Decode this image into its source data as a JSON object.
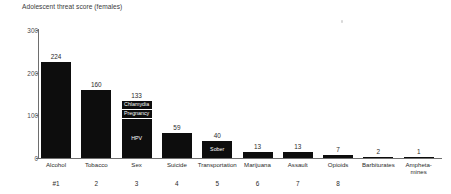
{
  "chart_data": {
    "type": "bar",
    "title": "Adolescent threat score (females)",
    "xlabel": "",
    "ylabel": "",
    "ylim": [
      0,
      300
    ],
    "yticks": [
      0,
      100,
      200,
      300
    ],
    "grid": false,
    "legend": "none",
    "categories": [
      "Alcohol",
      "Tobacco",
      "Sex",
      "Suicide",
      "Transportation",
      "Marijuana",
      "Assault",
      "Opioids",
      "Barbiturates",
      "Ampheta-\nmines"
    ],
    "values": [
      224,
      160,
      133,
      59,
      40,
      13,
      13,
      7,
      2,
      1
    ],
    "value_labels": [
      "224",
      "160",
      "133",
      "59",
      "40",
      "13",
      "13",
      "7",
      "2",
      "1"
    ],
    "ranks": [
      "#1",
      "2",
      "3",
      "4",
      "5",
      "6",
      "7",
      "8",
      "",
      ""
    ],
    "stacked_segment_labels": {
      "Sex": [
        "Chlamydia",
        "Pregnancy",
        "HPV"
      ],
      "Transportation": [
        "Sober"
      ]
    },
    "bar_color": "#0d0d0d",
    "axis_color": "#6e6e6e",
    "text_color": "#2b2b2b"
  },
  "series": [
    {
      "category": "Alcohol",
      "value": 224,
      "label": "224",
      "rank": "#1",
      "segments": []
    },
    {
      "category": "Tobacco",
      "value": 160,
      "label": "160",
      "rank": "2",
      "segments": []
    },
    {
      "category": "Sex",
      "value": 133,
      "label": "133",
      "rank": "3",
      "segments": [
        {
          "name": "Chlamydia",
          "value": 18
        },
        {
          "name": "Pregnancy",
          "value": 22
        },
        {
          "name": "HPV",
          "value": 93
        }
      ]
    },
    {
      "category": "Suicide",
      "value": 59,
      "label": "59",
      "rank": "4",
      "segments": []
    },
    {
      "category": "Transportation",
      "value": 40,
      "label": "40",
      "rank": "5",
      "segments": [
        {
          "name": "Sober",
          "value": 40
        }
      ]
    },
    {
      "category": "Marijuana",
      "value": 13,
      "label": "13",
      "rank": "6",
      "segments": []
    },
    {
      "category": "Assault",
      "value": 13,
      "label": "13",
      "rank": "7",
      "segments": []
    },
    {
      "category": "Opioids",
      "value": 7,
      "label": "7",
      "rank": "8",
      "segments": []
    },
    {
      "category": "Barbiturates",
      "value": 2,
      "label": "2",
      "rank": "",
      "segments": []
    },
    {
      "category": "Ampheta-mines",
      "value": 1,
      "label": "1",
      "rank": "",
      "segments": []
    }
  ],
  "axis": {
    "y_tick_labels": [
      "300",
      "200",
      "100",
      "0"
    ]
  }
}
